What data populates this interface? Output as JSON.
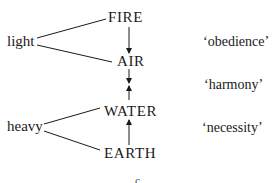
{
  "diagram": {
    "elements": [
      {
        "id": "fire",
        "label": "FIRE"
      },
      {
        "id": "air",
        "label": "AIR"
      },
      {
        "id": "water",
        "label": "WATER"
      },
      {
        "id": "earth",
        "label": "EARTH"
      }
    ],
    "groups": [
      {
        "label": "light",
        "members": [
          "FIRE",
          "AIR"
        ]
      },
      {
        "label": "heavy",
        "members": [
          "WATER",
          "EARTH"
        ]
      }
    ],
    "relations": [
      {
        "label": "‘obedience’",
        "between": [
          "FIRE",
          "AIR"
        ],
        "direction": "FIRE down to AIR"
      },
      {
        "label": "‘harmony’",
        "between": [
          "AIR",
          "WATER"
        ],
        "direction": "opposing arrows meeting between AIR and WATER"
      },
      {
        "label": "‘necessity’",
        "between": [
          "WATER",
          "EARTH"
        ],
        "direction": "EARTH up to WATER"
      }
    ],
    "bottom_fragment": "c",
    "colors": {
      "ink": "#1a1a1a",
      "background": "#ffffff"
    }
  }
}
